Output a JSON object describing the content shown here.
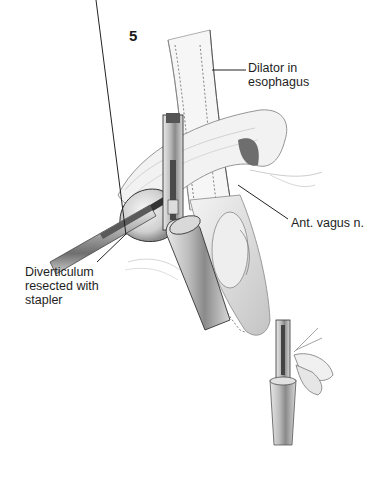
{
  "figure": {
    "number": "5",
    "labels": {
      "dilator_line1": "Dilator in",
      "dilator_line2": "esophagus",
      "vagus": "Ant. vagus n.",
      "diverticulum_line1": "Diverticulum",
      "diverticulum_line2": "resected with",
      "diverticulum_line3": "stapler"
    }
  }
}
